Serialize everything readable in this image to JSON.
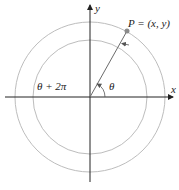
{
  "diagram": {
    "labels": {
      "y_axis": "y",
      "x_axis": "x",
      "point": "P = (x, y)",
      "angle": "θ",
      "angle_plus": "θ + 2π"
    },
    "colors": {
      "axis": "#222222",
      "circle": "#b8b8b8",
      "ray": "#6b6b6b",
      "point": "#8a8a8a"
    }
  }
}
